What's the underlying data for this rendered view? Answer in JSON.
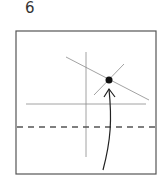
{
  "step": {
    "number": "6"
  },
  "diagram": {
    "paper": {
      "x": 16,
      "y": 31,
      "width": 140,
      "height": 143,
      "stroke": "#555555"
    },
    "crease_lines": [
      {
        "name": "vertical-crease",
        "x1": 86,
        "y1": 52,
        "x2": 86,
        "y2": 157
      },
      {
        "name": "horizontal-crease",
        "x1": 26,
        "y1": 104,
        "x2": 146,
        "y2": 104
      },
      {
        "name": "long-diagonal-crease",
        "x1": 66,
        "y1": 57,
        "x2": 149,
        "y2": 100
      },
      {
        "name": "short-diagonal-crease",
        "x1": 124,
        "y1": 64,
        "x2": 94,
        "y2": 95
      }
    ],
    "fold_line": {
      "type": "valley",
      "style": "dashed",
      "x1": 17,
      "y1": 127,
      "x2": 155,
      "y2": 127
    },
    "reference_point": {
      "cx": 109,
      "cy": 80,
      "r": 3.5,
      "color": "#111111"
    },
    "arrow": {
      "from": [
        103,
        170
      ],
      "to": [
        109,
        89
      ]
    }
  }
}
